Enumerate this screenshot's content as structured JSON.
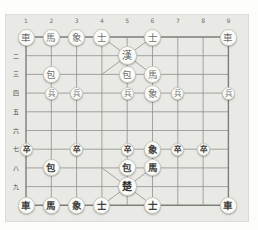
{
  "board": {
    "game": "janggi",
    "files": 9,
    "ranks": 10,
    "file_labels": [
      "1",
      "2",
      "3",
      "4",
      "5",
      "6",
      "7",
      "8",
      "9"
    ],
    "rank_labels": [
      {
        "rank": 2,
        "label": "二"
      },
      {
        "rank": 3,
        "label": "三"
      },
      {
        "rank": 4,
        "label": "四"
      },
      {
        "rank": 5,
        "label": "五"
      },
      {
        "rank": 6,
        "label": "六"
      },
      {
        "rank": 7,
        "label": "七"
      },
      {
        "rank": 8,
        "label": "八"
      },
      {
        "rank": 9,
        "label": "九"
      }
    ],
    "colors": {
      "panel_bg": "#e9eae5",
      "page_bg": "#fdfdfc",
      "grid_line": "#8f908b",
      "grid_border": "#7d7e79",
      "piece_bg": "#fcfcf9",
      "han_text": "#6e7072",
      "cho_text": "#3f403d",
      "label_text": "#6f706c"
    },
    "pieces": [
      {
        "side": "han",
        "type": "chariot",
        "glyph": "車",
        "file": 1,
        "rank": 1
      },
      {
        "side": "han",
        "type": "horse",
        "glyph": "馬",
        "file": 2,
        "rank": 1
      },
      {
        "side": "han",
        "type": "elephant",
        "glyph": "象",
        "file": 3,
        "rank": 1
      },
      {
        "side": "han",
        "type": "guard",
        "glyph": "士",
        "file": 4,
        "rank": 1
      },
      {
        "side": "han",
        "type": "guard",
        "glyph": "士",
        "file": 6,
        "rank": 1
      },
      {
        "side": "han",
        "type": "chariot",
        "glyph": "車",
        "file": 9,
        "rank": 1
      },
      {
        "side": "han",
        "type": "king",
        "glyph": "漢",
        "file": 5,
        "rank": 2
      },
      {
        "side": "han",
        "type": "cannon",
        "glyph": "包",
        "file": 2,
        "rank": 3
      },
      {
        "side": "han",
        "type": "cannon",
        "glyph": "包",
        "file": 5,
        "rank": 3
      },
      {
        "side": "han",
        "type": "horse",
        "glyph": "馬",
        "file": 6,
        "rank": 3
      },
      {
        "side": "han",
        "type": "pawn",
        "glyph": "兵",
        "file": 2,
        "rank": 4
      },
      {
        "side": "han",
        "type": "pawn",
        "glyph": "兵",
        "file": 3,
        "rank": 4
      },
      {
        "side": "han",
        "type": "pawn",
        "glyph": "兵",
        "file": 5,
        "rank": 4
      },
      {
        "side": "han",
        "type": "elephant",
        "glyph": "象",
        "file": 6,
        "rank": 4
      },
      {
        "side": "han",
        "type": "pawn",
        "glyph": "兵",
        "file": 7,
        "rank": 4
      },
      {
        "side": "han",
        "type": "pawn",
        "glyph": "兵",
        "file": 9,
        "rank": 4
      },
      {
        "side": "cho",
        "type": "pawn",
        "glyph": "卒",
        "file": 1,
        "rank": 7
      },
      {
        "side": "cho",
        "type": "pawn",
        "glyph": "卒",
        "file": 3,
        "rank": 7
      },
      {
        "side": "cho",
        "type": "pawn",
        "glyph": "卒",
        "file": 5,
        "rank": 7
      },
      {
        "side": "cho",
        "type": "elephant",
        "glyph": "象",
        "file": 6,
        "rank": 7
      },
      {
        "side": "cho",
        "type": "pawn",
        "glyph": "卒",
        "file": 7,
        "rank": 7
      },
      {
        "side": "cho",
        "type": "pawn",
        "glyph": "卒",
        "file": 8,
        "rank": 7
      },
      {
        "side": "cho",
        "type": "cannon",
        "glyph": "包",
        "file": 2,
        "rank": 8
      },
      {
        "side": "cho",
        "type": "cannon",
        "glyph": "包",
        "file": 5,
        "rank": 8
      },
      {
        "side": "cho",
        "type": "horse",
        "glyph": "馬",
        "file": 6,
        "rank": 8
      },
      {
        "side": "cho",
        "type": "king",
        "glyph": "楚",
        "file": 5,
        "rank": 9
      },
      {
        "side": "cho",
        "type": "chariot",
        "glyph": "車",
        "file": 1,
        "rank": 10
      },
      {
        "side": "cho",
        "type": "horse",
        "glyph": "馬",
        "file": 2,
        "rank": 10
      },
      {
        "side": "cho",
        "type": "elephant",
        "glyph": "象",
        "file": 3,
        "rank": 10
      },
      {
        "side": "cho",
        "type": "guard",
        "glyph": "士",
        "file": 4,
        "rank": 10
      },
      {
        "side": "cho",
        "type": "guard",
        "glyph": "士",
        "file": 6,
        "rank": 10
      },
      {
        "side": "cho",
        "type": "chariot",
        "glyph": "車",
        "file": 9,
        "rank": 10
      }
    ]
  }
}
